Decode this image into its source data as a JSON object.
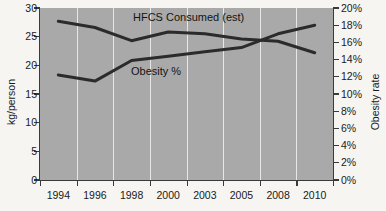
{
  "chart_data": {
    "type": "line",
    "title": "",
    "xlabel": "",
    "ylabel": "kg/person",
    "y2label": "Obesity rate",
    "categories": [
      "1994",
      "1996",
      "1998",
      "2000",
      "2003",
      "2005",
      "2008",
      "2010"
    ],
    "grid": true,
    "legend_position": "inline-annotations",
    "series": [
      {
        "name": "HFCS Consumed (est)",
        "axis": "left",
        "unit": "kg/person",
        "color": "#2b2b2b",
        "values": [
          27.7,
          26.6,
          24.3,
          25.8,
          25.5,
          24.6,
          24.2,
          22.2
        ]
      },
      {
        "name": "Obesity %",
        "axis": "right",
        "unit": "%",
        "color": "#2b2b2b",
        "values": [
          12.2,
          11.5,
          13.9,
          14.4,
          14.9,
          15.4,
          17.0,
          18.0
        ]
      }
    ],
    "left_axis": {
      "label": "kg/person",
      "min": 0,
      "max": 30,
      "step": 5,
      "ticks": [
        "0",
        "5",
        "10",
        "15",
        "20",
        "25",
        "30"
      ]
    },
    "right_axis": {
      "label": "Obesity rate",
      "min": 0,
      "max": 20,
      "step": 2,
      "ticks": [
        "0%",
        "2%",
        "4%",
        "6%",
        "8%",
        "10%",
        "12%",
        "14%",
        "16%",
        "18%",
        "20%"
      ]
    },
    "annotations": [
      {
        "text": "HFCS Consumed (est)",
        "series": "HFCS Consumed (est)"
      },
      {
        "text": "Obesity %",
        "series": "Obesity %"
      }
    ],
    "colors": {
      "plot_background": "#a9a9a9",
      "page_background": "#f6f5f2",
      "gridline": "#e7e7e4",
      "line": "#2b2b2b",
      "axis": "#3a3a38",
      "text": "#1a1a1a"
    }
  }
}
